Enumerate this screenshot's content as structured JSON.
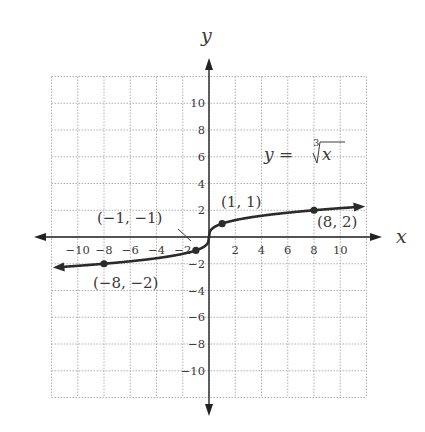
{
  "chart_data": {
    "type": "line",
    "title": "",
    "function": "y = cube_root(x)",
    "equation_label": {
      "lhs": "y =",
      "index": "3",
      "radicand": "x"
    },
    "xlabel": "x",
    "ylabel": "y",
    "xlim": [
      -12,
      12
    ],
    "ylim": [
      -12,
      12
    ],
    "grid": true,
    "grid_style": "dotted",
    "grid_step": 2,
    "x_ticks": [
      "-10",
      "-8",
      "-6",
      "-4",
      "-2",
      "2",
      "4",
      "6",
      "8",
      "10"
    ],
    "x_tick_values": [
      -10,
      -8,
      -6,
      -4,
      -2,
      2,
      4,
      6,
      8,
      10
    ],
    "y_ticks": [
      "10",
      "8",
      "6",
      "4",
      "2",
      "-2",
      "-4",
      "-6",
      "-8",
      "-10"
    ],
    "y_tick_values": [
      10,
      8,
      6,
      4,
      2,
      -2,
      -4,
      -6,
      -8,
      -10
    ],
    "series": [
      {
        "name": "y = ∛x",
        "x": [
          -11.5,
          -8,
          -1,
          0,
          1,
          8,
          11.5
        ],
        "y": [
          -2.26,
          -2,
          -1,
          0,
          1,
          2,
          2.26
        ]
      }
    ],
    "points": [
      {
        "x": -8,
        "y": -2,
        "label": "(−8, −2)"
      },
      {
        "x": -1,
        "y": -1,
        "label": "(−1, −1)"
      },
      {
        "x": 1,
        "y": 1,
        "label": "(1, 1)"
      },
      {
        "x": 8,
        "y": 2,
        "label": "(8, 2)"
      }
    ],
    "colors": {
      "curve": "#2b2b2b",
      "axis": "#222222",
      "grid": "#b0b0b0",
      "text": "#3a3a3a"
    }
  }
}
